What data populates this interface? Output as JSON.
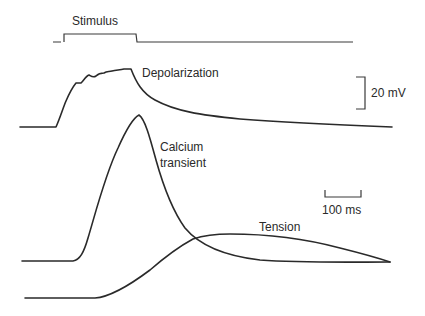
{
  "labels": {
    "stimulus": "Stimulus",
    "depolarization": "Depolarization",
    "calcium_line1": "Calcium",
    "calcium_line2": "transient",
    "tension": "Tension"
  },
  "scale_bars": {
    "voltage": "20 mV",
    "time": "100 ms"
  },
  "colors": {
    "ink": "#2a2a2a",
    "background": "#ffffff"
  }
}
